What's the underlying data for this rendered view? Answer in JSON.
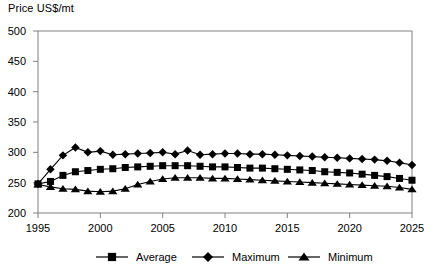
{
  "chart_data": {
    "type": "line",
    "title": "Price US$/mt",
    "xlabel": "",
    "ylabel": "Price US$/mt",
    "xlim": [
      1995,
      2025
    ],
    "ylim": [
      200,
      500
    ],
    "ytick_step": 50,
    "xtick_step": 5,
    "grid": false,
    "legend_position": "bottom",
    "xticks": [
      "1995",
      "2000",
      "2005",
      "2010",
      "2015",
      "2020",
      "2025"
    ],
    "yticks": [
      "200",
      "250",
      "300",
      "350",
      "400",
      "450",
      "500"
    ],
    "x": [
      1995,
      1996,
      1997,
      1998,
      1999,
      2000,
      2001,
      2002,
      2003,
      2004,
      2005,
      2006,
      2007,
      2008,
      2009,
      2010,
      2011,
      2012,
      2013,
      2014,
      2015,
      2016,
      2017,
      2018,
      2019,
      2020,
      2021,
      2022,
      2023,
      2024,
      2025
    ],
    "series": [
      {
        "name": "Average",
        "marker": "square",
        "values": [
          248,
          252,
          262,
          268,
          270,
          272,
          273,
          275,
          276,
          277,
          278,
          278,
          278,
          277,
          276,
          276,
          275,
          274,
          274,
          273,
          272,
          271,
          270,
          268,
          267,
          266,
          264,
          262,
          260,
          257,
          254
        ]
      },
      {
        "name": "Maximum",
        "marker": "diamond",
        "values": [
          248,
          272,
          295,
          308,
          300,
          302,
          296,
          297,
          298,
          299,
          300,
          297,
          303,
          296,
          297,
          298,
          298,
          297,
          297,
          296,
          295,
          294,
          293,
          292,
          291,
          290,
          289,
          288,
          286,
          283,
          279
        ]
      },
      {
        "name": "Minimum",
        "marker": "triangle",
        "values": [
          247,
          243,
          240,
          239,
          236,
          235,
          236,
          240,
          247,
          252,
          256,
          258,
          258,
          258,
          257,
          257,
          256,
          255,
          254,
          253,
          252,
          251,
          250,
          249,
          248,
          247,
          246,
          245,
          244,
          242,
          239
        ]
      }
    ],
    "legend": [
      {
        "label": "Average",
        "marker": "square"
      },
      {
        "label": "Maximum",
        "marker": "diamond"
      },
      {
        "label": "Minimum",
        "marker": "triangle"
      }
    ],
    "colors": {
      "series": "#000000",
      "frame": "#808080",
      "background": "#ffffff"
    }
  }
}
